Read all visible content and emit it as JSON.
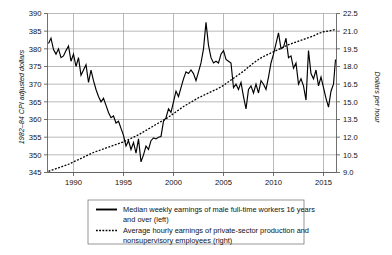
{
  "chart_data": {
    "type": "line",
    "title": "",
    "xlabel": "",
    "ylabel": "1982–84 CPI adjusted dollars",
    "y2label": "Dollars per hour",
    "xlim": [
      1987.4,
      2016.3
    ],
    "ylim": [
      345,
      390
    ],
    "y2lim": [
      9.0,
      22.5
    ],
    "grid": true,
    "legend_position": "below-center",
    "xticks": [
      1990,
      1995,
      2000,
      2005,
      2010,
      2015
    ],
    "xtick_labels": [
      "1990",
      "1995",
      "2000",
      "2005",
      "2010",
      "2015"
    ],
    "yticks": [
      345,
      350,
      355,
      360,
      365,
      370,
      375,
      380,
      385,
      390
    ],
    "ytick_labels": [
      "345",
      "350",
      "355",
      "360",
      "365",
      "370",
      "375",
      "380",
      "385",
      "390"
    ],
    "y2ticks": [
      9.0,
      10.5,
      12.0,
      13.5,
      15.0,
      16.5,
      18.0,
      19.5,
      21.0,
      22.5
    ],
    "y2tick_labels": [
      "9.0",
      "10.5",
      "12.0",
      "13.5",
      "15.0",
      "16.5",
      "18.0",
      "19.5",
      "21.0",
      "22.5"
    ],
    "series": [
      {
        "name": "Median weekly earnings of male full-time workers 16 years and over (left)",
        "axis": "left",
        "style": "solid",
        "color": "#000000",
        "x": [
          1987.5,
          1987.75,
          1988.0,
          1988.25,
          1988.5,
          1988.75,
          1989.0,
          1989.25,
          1989.5,
          1989.75,
          1990.0,
          1990.25,
          1990.5,
          1990.75,
          1991.0,
          1991.25,
          1991.5,
          1991.75,
          1992.0,
          1992.25,
          1992.5,
          1992.75,
          1993.0,
          1993.25,
          1993.5,
          1993.75,
          1994.0,
          1994.25,
          1994.5,
          1994.75,
          1995.0,
          1995.25,
          1995.5,
          1995.75,
          1996.0,
          1996.25,
          1996.5,
          1996.75,
          1997.0,
          1997.25,
          1997.5,
          1997.75,
          1998.0,
          1998.25,
          1998.5,
          1998.75,
          1999.0,
          1999.25,
          1999.5,
          1999.75,
          2000.0,
          2000.25,
          2000.5,
          2000.75,
          2001.0,
          2001.25,
          2001.5,
          2001.75,
          2002.0,
          2002.25,
          2002.5,
          2002.75,
          2003.0,
          2003.25,
          2003.5,
          2003.75,
          2004.0,
          2004.25,
          2004.5,
          2004.75,
          2005.0,
          2005.25,
          2005.5,
          2005.75,
          2006.0,
          2006.25,
          2006.5,
          2006.75,
          2007.0,
          2007.25,
          2007.5,
          2007.75,
          2008.0,
          2008.25,
          2008.5,
          2008.75,
          2009.0,
          2009.25,
          2009.5,
          2009.75,
          2010.0,
          2010.25,
          2010.5,
          2010.75,
          2011.0,
          2011.25,
          2011.5,
          2011.75,
          2012.0,
          2012.25,
          2012.5,
          2012.75,
          2013.0,
          2013.25,
          2013.5,
          2013.75,
          2014.0,
          2014.25,
          2014.5,
          2014.75,
          2015.0,
          2015.25,
          2015.5,
          2015.75,
          2016.0,
          2016.2
        ],
        "y": [
          381.5,
          383.0,
          379.8,
          378.5,
          380.0,
          377.5,
          378.0,
          379.5,
          380.8,
          376.5,
          378.5,
          375.0,
          377.5,
          372.5,
          374.0,
          375.5,
          370.5,
          374.0,
          371.0,
          368.5,
          366.5,
          365.0,
          366.0,
          364.0,
          362.0,
          360.5,
          361.0,
          359.0,
          359.5,
          357.5,
          355.5,
          352.5,
          354.0,
          351.5,
          353.5,
          350.5,
          354.5,
          348.0,
          350.0,
          352.5,
          351.5,
          354.0,
          354.8,
          354.5,
          355.0,
          355.2,
          359.5,
          360.5,
          363.0,
          362.0,
          365.0,
          368.0,
          366.5,
          369.0,
          371.5,
          373.5,
          373.0,
          374.0,
          373.0,
          371.0,
          373.5,
          376.0,
          380.0,
          387.5,
          381.0,
          377.5,
          376.0,
          376.5,
          376.0,
          378.5,
          379.5,
          377.0,
          376.5,
          376.0,
          369.0,
          370.0,
          368.5,
          370.5,
          366.5,
          363.0,
          368.5,
          369.5,
          367.5,
          370.0,
          367.5,
          371.0,
          370.0,
          368.5,
          372.0,
          376.0,
          378.5,
          381.5,
          384.5,
          380.0,
          380.5,
          383.0,
          377.5,
          378.0,
          374.5,
          376.0,
          370.0,
          371.5,
          369.5,
          365.5,
          379.5,
          373.0,
          371.5,
          374.0,
          369.5,
          372.0,
          369.0,
          366.0,
          363.5,
          368.0,
          370.0,
          377.0
        ]
      },
      {
        "name": "Average hourly earnings of private-sector production and nonsupervisory employees (right)",
        "axis": "right",
        "style": "dotted",
        "color": "#000000",
        "x": [
          1987.5,
          1988.0,
          1988.5,
          1989.0,
          1989.5,
          1990.0,
          1990.5,
          1991.0,
          1991.5,
          1992.0,
          1992.5,
          1993.0,
          1993.5,
          1994.0,
          1994.5,
          1995.0,
          1995.5,
          1996.0,
          1996.5,
          1997.0,
          1997.5,
          1998.0,
          1998.5,
          1999.0,
          1999.5,
          2000.0,
          2000.5,
          2001.0,
          2001.5,
          2002.0,
          2002.5,
          2003.0,
          2003.5,
          2004.0,
          2004.5,
          2005.0,
          2005.5,
          2006.0,
          2006.5,
          2007.0,
          2007.5,
          2008.0,
          2008.5,
          2009.0,
          2009.5,
          2010.0,
          2010.5,
          2011.0,
          2011.5,
          2012.0,
          2012.5,
          2013.0,
          2013.5,
          2014.0,
          2014.5,
          2015.0,
          2015.5,
          2016.0,
          2016.2
        ],
        "y": [
          9.1,
          9.25,
          9.4,
          9.55,
          9.7,
          9.9,
          10.1,
          10.3,
          10.5,
          10.7,
          10.85,
          11.0,
          11.15,
          11.3,
          11.45,
          11.6,
          11.8,
          12.0,
          12.2,
          12.45,
          12.7,
          12.95,
          13.2,
          13.45,
          13.7,
          14.0,
          14.3,
          14.6,
          14.85,
          15.1,
          15.35,
          15.55,
          15.75,
          15.95,
          16.15,
          16.4,
          16.7,
          17.0,
          17.3,
          17.6,
          17.95,
          18.3,
          18.6,
          18.85,
          19.05,
          19.25,
          19.45,
          19.65,
          19.85,
          20.0,
          20.15,
          20.3,
          20.45,
          20.6,
          20.8,
          20.95,
          21.0,
          21.1,
          21.15
        ]
      }
    ],
    "legend": [
      {
        "style": "solid",
        "line1": "Median weekly earnings of male full-time workers 16 years",
        "line2": "and over (left)"
      },
      {
        "style": "dotted",
        "line1": "Average hourly earnings of private-sector production and",
        "line2": "nonsupervisory employees (right)"
      }
    ]
  }
}
